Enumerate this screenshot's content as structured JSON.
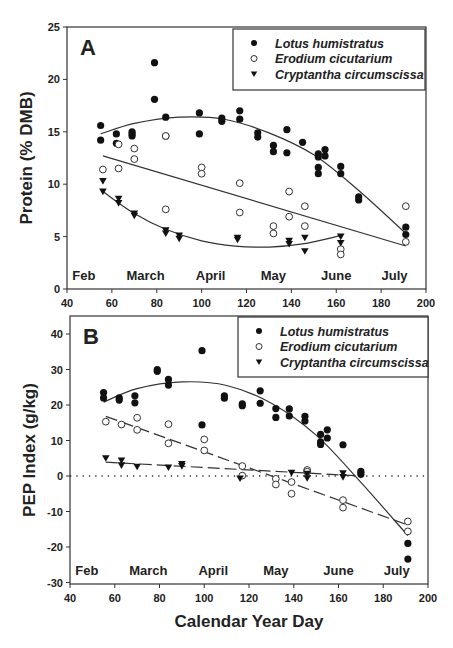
{
  "chart_data": [
    {
      "type": "scatter",
      "panel": "A",
      "title": "",
      "xlabel": "",
      "ylabel": "Protein (% DMB)",
      "xlim": [
        40,
        200
      ],
      "ylim": [
        0,
        25
      ],
      "xticks": [
        40,
        60,
        80,
        100,
        120,
        140,
        160,
        180,
        200
      ],
      "yticks": [
        0,
        5,
        10,
        15,
        20,
        25
      ],
      "months": [
        {
          "label": "Feb",
          "x": 47.5
        },
        {
          "label": "March",
          "x": 75
        },
        {
          "label": "April",
          "x": 104
        },
        {
          "label": "May",
          "x": 132
        },
        {
          "label": "June",
          "x": 160
        },
        {
          "label": "July",
          "x": 186
        }
      ],
      "grid": false,
      "legend_position": "top-right",
      "series": [
        {
          "name": "Lotus humistratus",
          "marker": "filled-circle",
          "points": [
            [
              55,
              15.6
            ],
            [
              55,
              14.2
            ],
            [
              62,
              14.8
            ],
            [
              62,
              13.9
            ],
            [
              69,
              15.0
            ],
            [
              69,
              14.6
            ],
            [
              69,
              14.8
            ],
            [
              79,
              21.6
            ],
            [
              79,
              18.1
            ],
            [
              84,
              16.4
            ],
            [
              84,
              14.6
            ],
            [
              99,
              16.8
            ],
            [
              99,
              14.8
            ],
            [
              109,
              16.3
            ],
            [
              109,
              16.0
            ],
            [
              117,
              17.0
            ],
            [
              117,
              16.2
            ],
            [
              125,
              14.9
            ],
            [
              125,
              14.5
            ],
            [
              132,
              13.7
            ],
            [
              132,
              13.1
            ],
            [
              138,
              15.2
            ],
            [
              138,
              13.0
            ],
            [
              145,
              14.0
            ],
            [
              152,
              12.9
            ],
            [
              152,
              12.6
            ],
            [
              152,
              11.6
            ],
            [
              152,
              11.0
            ],
            [
              155,
              13.3
            ],
            [
              155,
              12.7
            ],
            [
              162,
              11.7
            ],
            [
              162,
              11.0
            ],
            [
              170,
              8.8
            ],
            [
              170,
              8.5
            ],
            [
              191,
              5.9
            ],
            [
              191,
              5.2
            ]
          ],
          "fit": [
            [
              55,
              14.8
            ],
            [
              70,
              15.8
            ],
            [
              90,
              16.4
            ],
            [
              110,
              16.2
            ],
            [
              130,
              14.9
            ],
            [
              150,
              12.8
            ],
            [
              170,
              9.4
            ],
            [
              191,
              5.3
            ]
          ]
        },
        {
          "name": "Erodium cicutarium",
          "marker": "open-circle",
          "points": [
            [
              56,
              11.4
            ],
            [
              63,
              13.8
            ],
            [
              63,
              11.5
            ],
            [
              70,
              13.4
            ],
            [
              70,
              12.4
            ],
            [
              84,
              14.6
            ],
            [
              84,
              7.6
            ],
            [
              100,
              11.6
            ],
            [
              100,
              11.0
            ],
            [
              117,
              10.1
            ],
            [
              117,
              7.3
            ],
            [
              132,
              6.0
            ],
            [
              132,
              5.3
            ],
            [
              139,
              9.3
            ],
            [
              139,
              6.9
            ],
            [
              146,
              7.9
            ],
            [
              146,
              6.0
            ],
            [
              162,
              3.8
            ],
            [
              162,
              3.3
            ],
            [
              191,
              7.9
            ],
            [
              191,
              4.5
            ]
          ],
          "fit": [
            [
              56,
              12.7
            ],
            [
              191,
              4.1
            ]
          ]
        },
        {
          "name": "Cryptantha circumscissa",
          "marker": "filled-triangle-down",
          "points": [
            [
              56,
              10.3
            ],
            [
              56,
              9.3
            ],
            [
              63,
              8.6
            ],
            [
              63,
              8.2
            ],
            [
              70,
              7.2
            ],
            [
              70,
              7.0
            ],
            [
              84,
              5.6
            ],
            [
              84,
              5.3
            ],
            [
              90,
              5.1
            ],
            [
              90,
              4.8
            ],
            [
              116,
              4.9
            ],
            [
              116,
              4.7
            ],
            [
              139,
              4.6
            ],
            [
              139,
              4.3
            ],
            [
              146,
              4.9
            ],
            [
              146,
              3.6
            ],
            [
              162,
              5.0
            ],
            [
              162,
              4.4
            ]
          ],
          "fit": [
            [
              56,
              9.3
            ],
            [
              70,
              7.2
            ],
            [
              84,
              5.7
            ],
            [
              100,
              4.6
            ],
            [
              115,
              4.1
            ],
            [
              130,
              4.0
            ],
            [
              145,
              4.3
            ],
            [
              162,
              5.1
            ]
          ]
        }
      ]
    },
    {
      "type": "scatter",
      "panel": "B",
      "title": "",
      "xlabel": "Calendar Year Day",
      "ylabel": "PEP Index (g/kg)",
      "xlim": [
        40,
        200
      ],
      "ylim": [
        -30,
        45
      ],
      "xticks": [
        40,
        60,
        80,
        100,
        120,
        140,
        160,
        180,
        200
      ],
      "yticks": [
        -30,
        -20,
        -10,
        0,
        10,
        20,
        30,
        40
      ],
      "months": [
        {
          "label": "Feb",
          "x": 47.5
        },
        {
          "label": "March",
          "x": 75
        },
        {
          "label": "April",
          "x": 104
        },
        {
          "label": "May",
          "x": 132
        },
        {
          "label": "June",
          "x": 160
        },
        {
          "label": "July",
          "x": 186
        }
      ],
      "zero_line": "dotted",
      "grid": false,
      "legend_position": "top-right",
      "series": [
        {
          "name": "Lotus humistratus",
          "marker": "filled-circle",
          "fit_style": "solid",
          "points": [
            [
              55,
              23.5
            ],
            [
              55,
              22.0
            ],
            [
              62,
              22.0
            ],
            [
              62,
              21.4
            ],
            [
              69,
              22.6
            ],
            [
              69,
              20.6
            ],
            [
              79,
              30.0
            ],
            [
              79,
              29.5
            ],
            [
              84,
              27.2
            ],
            [
              84,
              25.6
            ],
            [
              99,
              35.3
            ],
            [
              99,
              14.4
            ],
            [
              109,
              22.6
            ],
            [
              109,
              21.9
            ],
            [
              117,
              20.3
            ],
            [
              117,
              19.8
            ],
            [
              125,
              24.0
            ],
            [
              125,
              20.5
            ],
            [
              132,
              19.0
            ],
            [
              132,
              16.5
            ],
            [
              138,
              18.9
            ],
            [
              138,
              16.9
            ],
            [
              145,
              16.8
            ],
            [
              145,
              15.5
            ],
            [
              152,
              11.7
            ],
            [
              152,
              9.6
            ],
            [
              152,
              8.9
            ],
            [
              155,
              13.0
            ],
            [
              155,
              10.7
            ],
            [
              162,
              8.8
            ],
            [
              170,
              1.3
            ],
            [
              170,
              0.5
            ],
            [
              191,
              -19.0
            ],
            [
              191,
              -23.4
            ]
          ],
          "fit": [
            [
              55,
              20.8
            ],
            [
              70,
              24.6
            ],
            [
              90,
              26.5
            ],
            [
              110,
              25.5
            ],
            [
              130,
              20.5
            ],
            [
              150,
              11.5
            ],
            [
              170,
              -1.8
            ],
            [
              191,
              -16.8
            ]
          ]
        },
        {
          "name": "Erodium cicutarium",
          "marker": "open-circle",
          "fit_style": "dashed",
          "points": [
            [
              56,
              15.3
            ],
            [
              63,
              14.5
            ],
            [
              70,
              16.4
            ],
            [
              70,
              13.0
            ],
            [
              84,
              14.6
            ],
            [
              84,
              9.2
            ],
            [
              100,
              10.3
            ],
            [
              100,
              7.2
            ],
            [
              117,
              2.8
            ],
            [
              117,
              0.1
            ],
            [
              132,
              -0.8
            ],
            [
              132,
              -2.4
            ],
            [
              139,
              -1.7
            ],
            [
              139,
              -5.0
            ],
            [
              146,
              1.7
            ],
            [
              146,
              1.2
            ],
            [
              162,
              -6.8
            ],
            [
              162,
              -8.9
            ],
            [
              191,
              -12.8
            ],
            [
              191,
              -15.6
            ]
          ],
          "fit": [
            [
              56,
              16.8
            ],
            [
              191,
              -13.8
            ]
          ]
        },
        {
          "name": "Cryptantha circumscissa",
          "marker": "filled-triangle-down",
          "fit_style": "dashed",
          "points": [
            [
              56,
              5.0
            ],
            [
              63,
              4.4
            ],
            [
              63,
              3.0
            ],
            [
              70,
              2.6
            ],
            [
              84,
              2.4
            ],
            [
              90,
              3.4
            ],
            [
              90,
              2.8
            ],
            [
              116,
              -0.7
            ],
            [
              139,
              0.9
            ],
            [
              146,
              0.6
            ],
            [
              146,
              -0.6
            ],
            [
              162,
              0.8
            ],
            [
              162,
              -0.3
            ],
            [
              170,
              0.3
            ]
          ],
          "fit": [
            [
              56,
              3.9
            ],
            [
              170,
              0.0
            ]
          ]
        }
      ]
    }
  ]
}
